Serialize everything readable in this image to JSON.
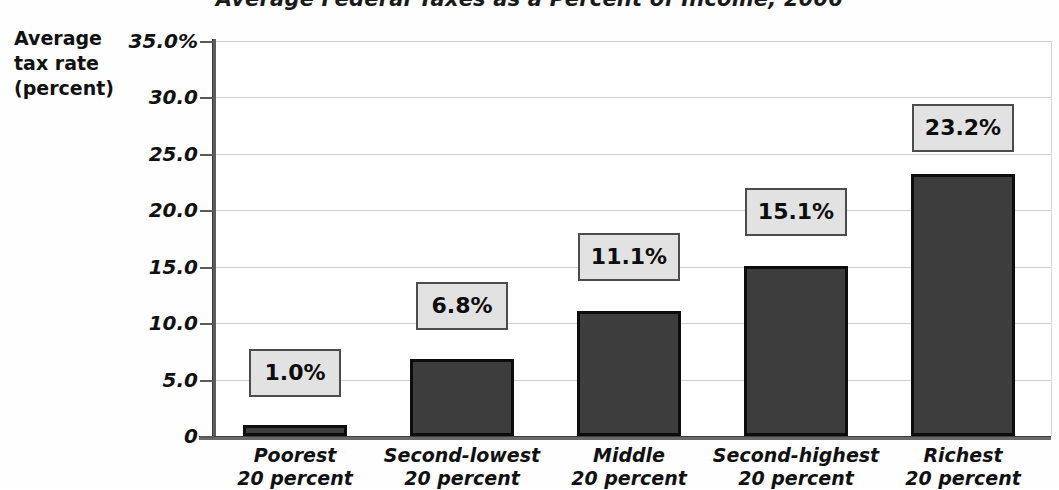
{
  "chart_data": {
    "type": "bar",
    "title": "Average Federal Taxes as a Percent of Income, 2006",
    "ylabel_lines": [
      "Average",
      "tax rate",
      "(percent)"
    ],
    "xlabel": "",
    "categories": [
      "Poorest 20 percent",
      "Second-lowest 20 percent",
      "Middle 20 percent",
      "Second-highest 20 percent",
      "Richest 20 percent"
    ],
    "category_lines": [
      {
        "line1": "Poorest",
        "line2": "20 percent"
      },
      {
        "line1": "Second-lowest",
        "line2": "20 percent"
      },
      {
        "line1": "Middle",
        "line2": "20 percent"
      },
      {
        "line1": "Second-highest",
        "line2": "20 percent"
      },
      {
        "line1": "Richest",
        "line2": "20 percent"
      }
    ],
    "values": [
      1.0,
      6.8,
      11.1,
      15.1,
      23.2
    ],
    "data_labels": [
      "1.0%",
      "6.8%",
      "11.1%",
      "15.1%",
      "23.2%"
    ],
    "ylim": [
      0,
      35
    ],
    "ytick_values": [
      35.0,
      30.0,
      25.0,
      20.0,
      15.0,
      10.0,
      5.0,
      0
    ],
    "ytick_labels": [
      "35.0%",
      "30.0",
      "25.0",
      "20.0",
      "15.0",
      "10.0",
      "5.0",
      "0"
    ],
    "grid": true,
    "legend": "none",
    "colors": {
      "bar_fill": "#3d3d3d",
      "bar_border": "#0d0d0d",
      "label_box_fill": "#e2e2e2",
      "label_box_border": "#4c4c4c",
      "gridline": "#cfcfcf",
      "axis": "#5a5a5a",
      "text": "#111111",
      "background": "#ffffff"
    }
  }
}
